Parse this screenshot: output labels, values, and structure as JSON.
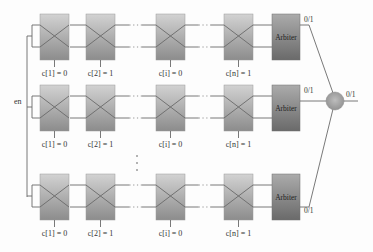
{
  "diagram": {
    "enable_label": "en",
    "colors": {
      "switch_top": "#cfcfcf",
      "switch_bottom": "#8f8f8f",
      "arbiter_top": "#a8a8a8",
      "arbiter_bottom": "#6e6e6e",
      "xor_fill": "#a9a9a9",
      "wire": "#6a6a6a"
    },
    "stages": [
      {
        "id": "1",
        "label": "c[1] = 0",
        "x": 40
      },
      {
        "id": "2",
        "label": "c[2] = 1",
        "x": 86
      },
      {
        "id": "i",
        "label": "c[i] = 0",
        "x": 156
      },
      {
        "id": "n",
        "label": "c[n] = 1",
        "x": 224
      }
    ],
    "rows": [
      {
        "name": "row-1",
        "box_top": 14,
        "arbiter_label": "Arbiter",
        "output_label": "0/1"
      },
      {
        "name": "row-2",
        "box_top": 85,
        "arbiter_label": "Arbiter",
        "output_label": "0/1"
      },
      {
        "name": "row-3",
        "box_top": 174,
        "arbiter_label": "Arbiter",
        "output_label": "0/1"
      }
    ],
    "xor": {
      "label": "XOR",
      "output_label": "0/1"
    },
    "vertical_ellipsis": "⋮"
  }
}
